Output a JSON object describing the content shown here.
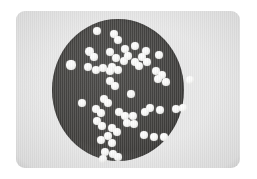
{
  "figure": {
    "caption": "",
    "media_type": "grayscale-photograph",
    "page_background": "#ffffff"
  },
  "photo": {
    "x": 16,
    "y": 11,
    "width": 224,
    "height": 157,
    "corner_radius": 9,
    "background_color": "#e9e9e9",
    "has_grain": true
  },
  "dish": {
    "label": "agar-plate",
    "center_x": 118,
    "center_y": 90,
    "radius_x": 66,
    "radius_y": 71,
    "fill_color": "#4b4a48",
    "edge_color": "#393836"
  },
  "colony": {
    "fill_color": "#fbfbfa",
    "shadow_color": "#bdbdb9",
    "count": 61
  },
  "colonies": [
    {
      "cx": 97,
      "cy": 31,
      "r": 4.3
    },
    {
      "cx": 114,
      "cy": 34,
      "r": 4.1
    },
    {
      "cx": 118,
      "cy": 40,
      "r": 4.2
    },
    {
      "cx": 125,
      "cy": 49,
      "r": 4.0
    },
    {
      "cx": 135,
      "cy": 46,
      "r": 3.9
    },
    {
      "cx": 146,
      "cy": 51,
      "r": 4.3
    },
    {
      "cx": 142,
      "cy": 57,
      "r": 4.0
    },
    {
      "cx": 159,
      "cy": 55,
      "r": 4.1
    },
    {
      "cx": 110,
      "cy": 52,
      "r": 4.4
    },
    {
      "cx": 116,
      "cy": 58,
      "r": 4.0
    },
    {
      "cx": 124,
      "cy": 61,
      "r": 4.2
    },
    {
      "cx": 89,
      "cy": 51,
      "r": 4.5
    },
    {
      "cx": 94,
      "cy": 57,
      "r": 3.7
    },
    {
      "cx": 112,
      "cy": 67,
      "r": 4.0
    },
    {
      "cx": 118,
      "cy": 70,
      "r": 3.9
    },
    {
      "cx": 103,
      "cy": 68,
      "r": 4.1
    },
    {
      "cx": 110,
      "cy": 71,
      "r": 3.8
    },
    {
      "cx": 135,
      "cy": 62,
      "r": 4.1
    },
    {
      "cx": 139,
      "cy": 66,
      "r": 3.9
    },
    {
      "cx": 147,
      "cy": 62,
      "r": 3.8
    },
    {
      "cx": 156,
      "cy": 71,
      "r": 4.2
    },
    {
      "cx": 162,
      "cy": 75,
      "r": 4.1
    },
    {
      "cx": 158,
      "cy": 79,
      "r": 3.9
    },
    {
      "cx": 166,
      "cy": 82,
      "r": 3.8
    },
    {
      "cx": 71,
      "cy": 65,
      "r": 4.6
    },
    {
      "cx": 88,
      "cy": 67,
      "r": 4.2
    },
    {
      "cx": 96,
      "cy": 70,
      "r": 4.0
    },
    {
      "cx": 190,
      "cy": 80,
      "r": 4.3
    },
    {
      "cx": 110,
      "cy": 81,
      "r": 4.0
    },
    {
      "cx": 115,
      "cy": 86,
      "r": 3.9
    },
    {
      "cx": 104,
      "cy": 99,
      "r": 4.1
    },
    {
      "cx": 108,
      "cy": 103,
      "r": 3.9
    },
    {
      "cx": 96,
      "cy": 109,
      "r": 4.0
    },
    {
      "cx": 101,
      "cy": 113,
      "r": 3.8
    },
    {
      "cx": 119,
      "cy": 112,
      "r": 4.1
    },
    {
      "cx": 125,
      "cy": 116,
      "r": 4.0
    },
    {
      "cx": 133,
      "cy": 116,
      "r": 4.1
    },
    {
      "cx": 145,
      "cy": 112,
      "r": 4.0
    },
    {
      "cx": 150,
      "cy": 108,
      "r": 3.9
    },
    {
      "cx": 160,
      "cy": 110,
      "r": 4.2
    },
    {
      "cx": 176,
      "cy": 109,
      "r": 4.2
    },
    {
      "cx": 183,
      "cy": 108,
      "r": 4.0
    },
    {
      "cx": 127,
      "cy": 123,
      "r": 4.1
    },
    {
      "cx": 134,
      "cy": 124,
      "r": 3.9
    },
    {
      "cx": 112,
      "cy": 128,
      "r": 4.2
    },
    {
      "cx": 117,
      "cy": 132,
      "r": 3.9
    },
    {
      "cx": 97,
      "cy": 121,
      "r": 4.0
    },
    {
      "cx": 102,
      "cy": 126,
      "r": 3.8
    },
    {
      "cx": 108,
      "cy": 136,
      "r": 4.0
    },
    {
      "cx": 101,
      "cy": 140,
      "r": 3.9
    },
    {
      "cx": 112,
      "cy": 143,
      "r": 4.0
    },
    {
      "cx": 144,
      "cy": 135,
      "r": 4.1
    },
    {
      "cx": 154,
      "cy": 137,
      "r": 4.0
    },
    {
      "cx": 164,
      "cy": 137,
      "r": 4.3
    },
    {
      "cx": 105,
      "cy": 152,
      "r": 4.0
    },
    {
      "cx": 113,
      "cy": 154,
      "r": 3.9
    },
    {
      "cx": 118,
      "cy": 157,
      "r": 3.8
    },
    {
      "cx": 103,
      "cy": 159,
      "r": 3.9
    },
    {
      "cx": 82,
      "cy": 103,
      "r": 4.0
    },
    {
      "cx": 131,
      "cy": 94,
      "r": 3.8
    },
    {
      "cx": 128,
      "cy": 56,
      "r": 3.7
    }
  ]
}
